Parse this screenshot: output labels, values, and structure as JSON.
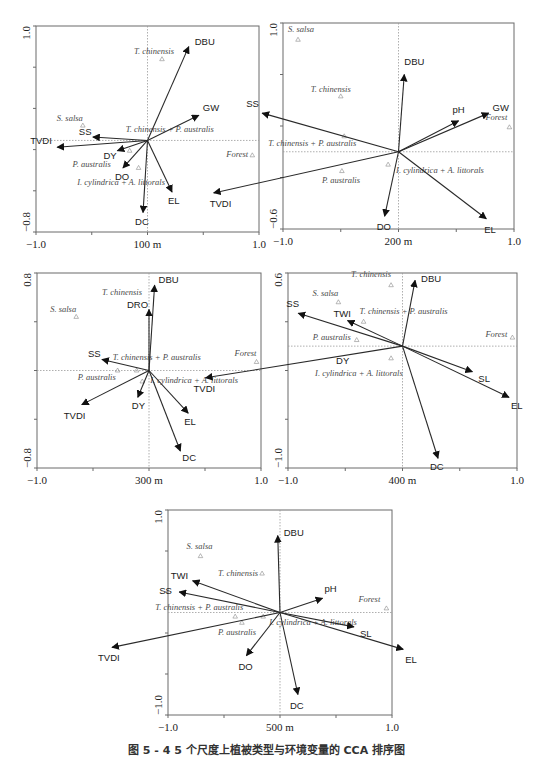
{
  "figure": {
    "caption": "图 5 - 4  5 个尺度上植被类型与环境变量的 CCA 排序图"
  },
  "chart_data": [
    {
      "type": "scatter",
      "subtype": "CCA biplot",
      "title": "",
      "scale_label": "100 m",
      "xlim": [
        -1.0,
        1.0
      ],
      "ylim": [
        -0.8,
        1.0
      ],
      "x_tick_labels": [
        "-1.0",
        "100 m",
        "1.0"
      ],
      "y_tick_labels": [
        "1.0",
        "-0.8"
      ],
      "frame_px": {
        "x0": 36,
        "y0": 26,
        "x1": 259,
        "y1": 232
      },
      "env_vectors": [
        {
          "name": "DBU",
          "x": 0.37,
          "y": 0.82,
          "lx": 6,
          "ly": -2
        },
        {
          "name": "GW",
          "x": 0.46,
          "y": 0.22,
          "lx": 4,
          "ly": -4
        },
        {
          "name": "SS",
          "x": -0.49,
          "y": 0.03,
          "lx": -14,
          "ly": -2
        },
        {
          "name": "TVDI",
          "x": -0.81,
          "y": -0.06,
          "lx": -27,
          "ly": -3
        },
        {
          "name": "DY",
          "x": -0.27,
          "y": -0.09,
          "lx": -14,
          "ly": 8
        },
        {
          "name": "DO",
          "x": -0.22,
          "y": -0.24,
          "lx": -8,
          "ly": 12
        },
        {
          "name": "EL",
          "x": 0.22,
          "y": -0.45,
          "lx": -4,
          "ly": 12
        },
        {
          "name": "DC",
          "x": -0.04,
          "y": -0.63,
          "lx": -8,
          "ly": 12
        }
      ],
      "species": [
        {
          "name": "T. chinensis",
          "x": 0.13,
          "y": 0.71,
          "lx": -28,
          "ly": -5
        },
        {
          "name": "S. salsa",
          "x": -0.58,
          "y": 0.13,
          "lx": -26,
          "ly": -5
        },
        {
          "name": "T. chinensis + P. australis",
          "x": -0.16,
          "y": -0.09,
          "lx": -4,
          "ly": -19
        },
        {
          "name": "P. australis",
          "x": -0.08,
          "y": -0.24,
          "lx": -66,
          "ly": -1
        },
        {
          "name": "I. cylindrica + A. littorals",
          "x": null,
          "y": null,
          "label_x": -0.63,
          "label_y": -0.39
        },
        {
          "name": "Forest",
          "x": 0.94,
          "y": -0.13,
          "lx": -26,
          "ly": 2
        }
      ]
    },
    {
      "type": "scatter",
      "subtype": "CCA biplot",
      "scale_label": "200 m",
      "xlim": [
        -1.0,
        1.0
      ],
      "ylim": [
        -0.6,
        1.0
      ],
      "x_tick_labels": [
        "-1.0",
        "200 m",
        "1.0"
      ],
      "y_tick_labels": [
        "1.0",
        "-0.6"
      ],
      "frame_px": {
        "x0": 283,
        "y0": 23,
        "x1": 514,
        "y1": 229
      },
      "env_vectors": [
        {
          "name": "DBU",
          "x": 0.05,
          "y": 0.6,
          "lx": 0,
          "ly": -10
        },
        {
          "name": "pH",
          "x": 0.52,
          "y": 0.24,
          "lx": -6,
          "ly": -8
        },
        {
          "name": "GW",
          "x": 0.78,
          "y": 0.3,
          "lx": 4,
          "ly": -2
        },
        {
          "name": "SS",
          "x": -1.18,
          "y": 0.3,
          "lx": -16,
          "ly": -6
        },
        {
          "name": "TVDI",
          "x": -1.6,
          "y": -0.32,
          "lx": -4,
          "ly": 14
        },
        {
          "name": "DO",
          "x": -0.12,
          "y": -0.5,
          "lx": -8,
          "ly": 14
        },
        {
          "name": "EL",
          "x": 0.76,
          "y": -0.52,
          "lx": -2,
          "ly": 14
        },
        {
          "name": "pH-GW-pair",
          "x": 0,
          "y": 0,
          "hidden": true
        }
      ],
      "species": [
        {
          "name": "S. salsa",
          "x": -0.87,
          "y": 0.87,
          "lx": -10,
          "ly": -8
        },
        {
          "name": "T. chinensis",
          "x": -0.5,
          "y": 0.43,
          "lx": -30,
          "ly": -4
        },
        {
          "name": "T. chinensis + P. australis",
          "x": -0.47,
          "y": 0.12,
          "lx": -76,
          "ly": 10
        },
        {
          "name": "P. australis",
          "x": -0.49,
          "y": -0.15,
          "lx": -20,
          "ly": 12
        },
        {
          "name": "I. cylindrica + A. littorals",
          "x": -0.09,
          "y": -0.1,
          "lx": 8,
          "ly": 8
        },
        {
          "name": "Forest",
          "x": 0.96,
          "y": 0.19,
          "lx": -24,
          "ly": -7
        }
      ]
    },
    {
      "type": "scatter",
      "subtype": "CCA biplot",
      "scale_label": "300 m",
      "xlim": [
        -1.0,
        1.0
      ],
      "ylim": [
        -0.8,
        0.8
      ],
      "x_tick_labels": [
        "-1.0",
        "300 m",
        "1.0"
      ],
      "y_tick_labels": [
        "0.8",
        "-0.8"
      ],
      "frame_px": {
        "x0": 37,
        "y0": 273,
        "x1": 261,
        "y1": 468
      },
      "env_vectors": [
        {
          "name": "DBU",
          "x": 0.05,
          "y": 0.7,
          "lx": 4,
          "ly": -2
        },
        {
          "name": "DRO",
          "x": 0.0,
          "y": 0.5,
          "lx": -22,
          "ly": -2
        },
        {
          "name": "SS",
          "x": -0.42,
          "y": 0.09,
          "lx": -14,
          "ly": -3
        },
        {
          "name": "TVDI",
          "x": -0.6,
          "y": -0.28,
          "lx": -18,
          "ly": 14
        },
        {
          "name": "DY",
          "x": -0.1,
          "y": -0.22,
          "lx": -6,
          "ly": 12
        },
        {
          "name": "EL",
          "x": 0.35,
          "y": -0.35,
          "lx": -4,
          "ly": 12
        },
        {
          "name": "DC",
          "x": 0.28,
          "y": -0.66,
          "lx": 2,
          "ly": 10
        }
      ],
      "species": [
        {
          "name": "T. chinensis",
          "x": null,
          "y": null,
          "label_x": -0.42,
          "label_y": 0.62
        },
        {
          "name": "S. salsa",
          "x": -0.65,
          "y": 0.44,
          "lx": -26,
          "ly": -5
        },
        {
          "name": "T. chinensis + P. australis",
          "x": -0.11,
          "y": 0.0,
          "lx": -24,
          "ly": -11
        },
        {
          "name": "P. australis",
          "x": -0.28,
          "y": 0.0,
          "lx": -40,
          "ly": 9
        },
        {
          "name": "I. cylindrica + A. littorals",
          "x": -0.06,
          "y": -0.09,
          "lx": 8,
          "ly": 2
        },
        {
          "name": "Forest",
          "x": 0.96,
          "y": 0.07,
          "lx": -22,
          "ly": -6
        }
      ]
    },
    {
      "type": "scatter",
      "subtype": "CCA biplot",
      "scale_label": "400 m",
      "xlim": [
        -1.0,
        1.0
      ],
      "ylim": [
        -1.0,
        0.6
      ],
      "x_tick_labels": [
        "-1.0",
        "400 m",
        "1.0"
      ],
      "y_tick_labels": [
        "0.6",
        "-1.0"
      ],
      "frame_px": {
        "x0": 288,
        "y0": 273,
        "x1": 517,
        "y1": 468
      },
      "env_vectors": [
        {
          "name": "DBU",
          "x": 0.11,
          "y": 0.54,
          "lx": 6,
          "ly": 2
        },
        {
          "name": "SS",
          "x": -0.91,
          "y": 0.27,
          "lx": -12,
          "ly": -6
        },
        {
          "name": "TWI",
          "x": -0.48,
          "y": 0.21,
          "lx": -14,
          "ly": -4
        },
        {
          "name": "TVDI",
          "x": -1.72,
          "y": -0.26,
          "lx": -12,
          "ly": 14
        },
        {
          "name": "SL",
          "x": 0.61,
          "y": -0.21,
          "lx": 6,
          "ly": 10
        },
        {
          "name": "EL",
          "x": 0.93,
          "y": -0.42,
          "lx": 2,
          "ly": 12
        },
        {
          "name": "DC",
          "x": 0.31,
          "y": -0.92,
          "lx": -8,
          "ly": 12
        },
        {
          "name": "DY",
          "x": null,
          "y": null,
          "label_only": true,
          "label_x": -0.58,
          "label_y": -0.15
        }
      ],
      "species": [
        {
          "name": "T. chinensis",
          "x": -0.1,
          "y": 0.5,
          "lx": -40,
          "ly": -8
        },
        {
          "name": "S. salsa",
          "x": -0.56,
          "y": 0.36,
          "lx": -26,
          "ly": -6
        },
        {
          "name": "T. chinensis + P. australis",
          "x": -0.34,
          "y": 0.2,
          "lx": -4,
          "ly": -8
        },
        {
          "name": "P. australis",
          "x": -0.4,
          "y": 0.05,
          "lx": -44,
          "ly": 0
        },
        {
          "name": "I. cylindrica + A. littorals",
          "x": -0.1,
          "y": -0.1,
          "lx": -76,
          "ly": 18
        },
        {
          "name": "Forest",
          "x": 0.96,
          "y": 0.07,
          "lx": -27,
          "ly": -1
        }
      ]
    },
    {
      "type": "scatter",
      "subtype": "CCA biplot",
      "scale_label": "500 m",
      "xlim": [
        -1.0,
        1.0
      ],
      "ylim": [
        -1.0,
        1.0
      ],
      "x_tick_labels": [
        "-1.0",
        "500 m",
        "1.0"
      ],
      "y_tick_labels": [
        "1.0",
        "-1.0"
      ],
      "frame_px": {
        "x0": 168,
        "y0": 510,
        "x1": 392,
        "y1": 715
      },
      "env_vectors": [
        {
          "name": "DBU",
          "x": -0.02,
          "y": 0.75,
          "lx": 6,
          "ly": 0
        },
        {
          "name": "TWI",
          "x": -0.78,
          "y": 0.31,
          "lx": -22,
          "ly": -2
        },
        {
          "name": "SS",
          "x": -0.9,
          "y": 0.2,
          "lx": -20,
          "ly": 2
        },
        {
          "name": "pH",
          "x": 0.38,
          "y": 0.14,
          "lx": 2,
          "ly": -6
        },
        {
          "name": "TVDI",
          "x": -1.5,
          "y": -0.34,
          "lx": -14,
          "ly": 14
        },
        {
          "name": "DO",
          "x": -0.3,
          "y": -0.42,
          "lx": -8,
          "ly": 14
        },
        {
          "name": "SL",
          "x": 0.66,
          "y": -0.14,
          "lx": 6,
          "ly": 10
        },
        {
          "name": "EL",
          "x": 1.1,
          "y": -0.36,
          "lx": 2,
          "ly": 14
        },
        {
          "name": "DC",
          "x": 0.16,
          "y": -0.8,
          "lx": -8,
          "ly": 14
        }
      ],
      "species": [
        {
          "name": "S. salsa",
          "x": -0.71,
          "y": 0.55,
          "lx": -14,
          "ly": -7
        },
        {
          "name": "T. chinensis",
          "x": -0.16,
          "y": 0.38,
          "lx": -44,
          "ly": 2
        },
        {
          "name": "T. chinensis + P. australis",
          "x": -0.4,
          "y": -0.04,
          "lx": -80,
          "ly": -7
        },
        {
          "name": "P. australis",
          "x": -0.34,
          "y": -0.1,
          "lx": -24,
          "ly": 12
        },
        {
          "name": "I. cylindrica + A. littorals",
          "x": -0.15,
          "y": -0.04,
          "lx": 6,
          "ly": 8
        },
        {
          "name": "Forest",
          "x": 0.95,
          "y": 0.04,
          "lx": -28,
          "ly": -6
        }
      ]
    }
  ]
}
